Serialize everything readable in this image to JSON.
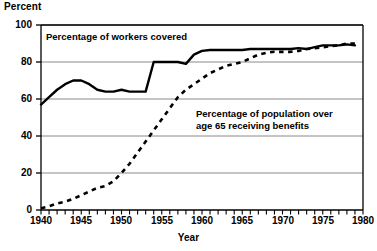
{
  "chart_data": {
    "type": "line",
    "title": "",
    "ylabel": "Percent",
    "xlabel": "Year",
    "ylim": [
      0,
      100
    ],
    "xlim": [
      1940,
      1980
    ],
    "y_ticks": [
      0,
      20,
      40,
      60,
      80,
      100
    ],
    "x_ticks": [
      1940,
      1945,
      1950,
      1955,
      1960,
      1965,
      1970,
      1975,
      1980
    ],
    "x_minor_tick_interval": 1,
    "grid": "horizontal",
    "legend": "inline-annotations",
    "series": [
      {
        "name": "Percentage of workers covered",
        "style": "solid",
        "color": "#000000",
        "x": [
          1940,
          1941,
          1942,
          1943,
          1944,
          1945,
          1946,
          1947,
          1948,
          1949,
          1950,
          1951,
          1952,
          1953,
          1954,
          1955,
          1956,
          1957,
          1958,
          1959,
          1960,
          1961,
          1962,
          1963,
          1964,
          1965,
          1966,
          1967,
          1968,
          1969,
          1970,
          1971,
          1972,
          1973,
          1974,
          1975,
          1976,
          1977,
          1978,
          1979
        ],
        "values": [
          57,
          61,
          65,
          68,
          70,
          70,
          68,
          65,
          64,
          64,
          65,
          64,
          64,
          64,
          80,
          80,
          80,
          80,
          79,
          84,
          86,
          86.5,
          86.5,
          86.5,
          86.5,
          86.5,
          87,
          87,
          87,
          87,
          87,
          87,
          87.5,
          87,
          88,
          89,
          89,
          89,
          89.5,
          89
        ]
      },
      {
        "name": "Percentage of population over age 65 receiving benefits",
        "style": "dashed",
        "color": "#000000",
        "x": [
          1940,
          1941,
          1942,
          1943,
          1944,
          1945,
          1946,
          1947,
          1948,
          1949,
          1950,
          1951,
          1952,
          1953,
          1954,
          1955,
          1956,
          1957,
          1958,
          1959,
          1960,
          1961,
          1962,
          1963,
          1964,
          1965,
          1966,
          1967,
          1968,
          1969,
          1970,
          1971,
          1972,
          1973,
          1974,
          1975,
          1976,
          1977,
          1978,
          1979
        ],
        "values": [
          1,
          2,
          3.5,
          4.5,
          6,
          8,
          10,
          12,
          13,
          15.5,
          20,
          25,
          31,
          37,
          43,
          49,
          55,
          61,
          65,
          68,
          71,
          74,
          76,
          78,
          79,
          80,
          82,
          84,
          85,
          85.5,
          85.5,
          85.5,
          86,
          87,
          87.5,
          88,
          88.5,
          89,
          90,
          90
        ]
      }
    ],
    "annotations": [
      {
        "text": "Percentage of workers covered",
        "for": "workers"
      },
      {
        "text_line1": "Percentage of population over",
        "text_line2": "age 65 receiving benefits",
        "for": "elderly"
      }
    ]
  },
  "labels": {
    "y_axis_title": "Percent",
    "x_axis_title": "Year",
    "y_ticks": [
      "0",
      "20",
      "40",
      "60",
      "80",
      "100"
    ],
    "x_ticks": [
      "1940",
      "1945",
      "1950",
      "1955",
      "1960",
      "1965",
      "1970",
      "1975",
      "1980"
    ],
    "annotation_workers": "Percentage of workers covered",
    "annotation_elderly_line1": "Percentage of population over",
    "annotation_elderly_line2": "age 65 receiving benefits"
  },
  "colors": {
    "background": "#ffffff",
    "ink": "#000000",
    "gridline": "#8a8a8a",
    "axis": "#000000"
  }
}
